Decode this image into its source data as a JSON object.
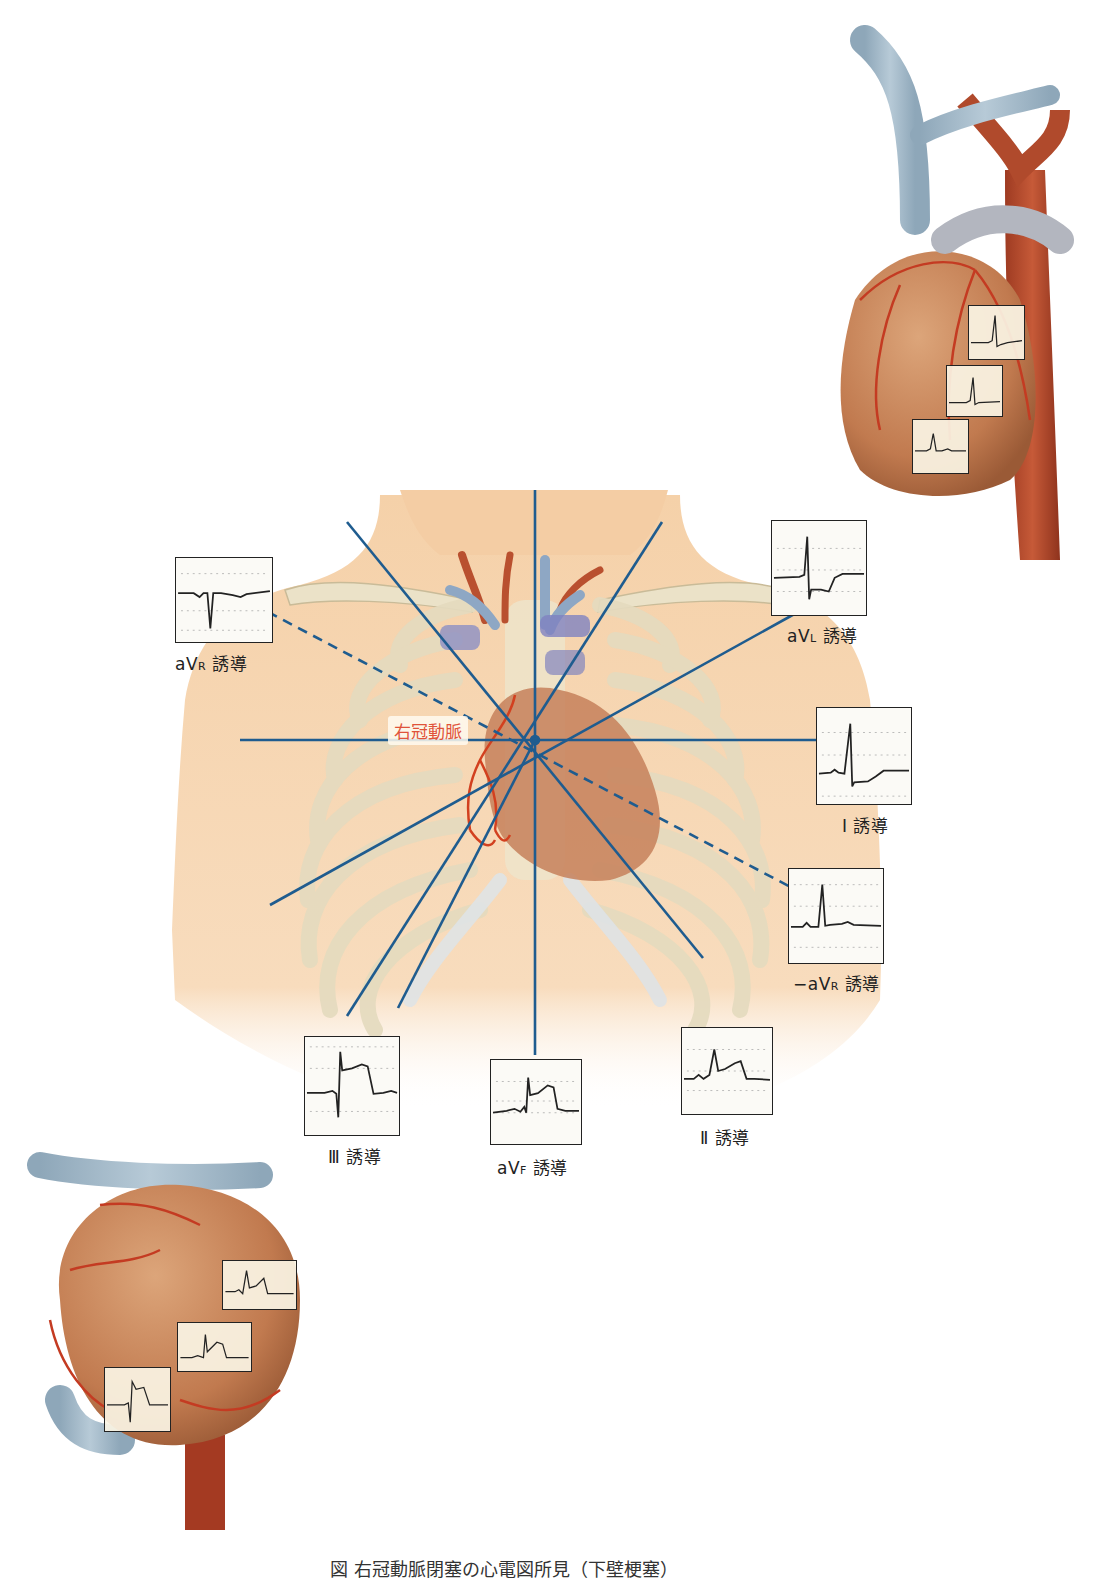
{
  "diagram": {
    "title_caption": "図 右冠動脈閉塞の心電図所見（下壁梗塞）",
    "rca_label": "右冠動脈",
    "center": {
      "x": 535,
      "y": 740
    },
    "axis_color": "#1f5c8f",
    "rca_color": "#e0533a",
    "leads": [
      {
        "id": "aVR",
        "label_main": "aV",
        "label_sub": "R",
        "label_suffix": "誘導",
        "box": {
          "x": 175,
          "y": 557,
          "w": 98,
          "h": 86
        },
        "label_pos": {
          "x": 175,
          "y": 650
        },
        "waveform": "negative-qrs"
      },
      {
        "id": "aVL",
        "label_main": "aV",
        "label_sub": "L",
        "label_suffix": "誘導",
        "box": {
          "x": 771,
          "y": 520,
          "w": 96,
          "h": 96
        },
        "label_pos": {
          "x": 787,
          "y": 622
        },
        "waveform": "r-with-st-depression"
      },
      {
        "id": "I",
        "label_main": "Ⅰ",
        "label_sub": "",
        "label_suffix": "誘導",
        "box": {
          "x": 816,
          "y": 707,
          "w": 96,
          "h": 98
        },
        "label_pos": {
          "x": 842,
          "y": 812
        },
        "waveform": "r-with-st-depression"
      },
      {
        "id": "-aVR",
        "label_main": "−aV",
        "label_sub": "R",
        "label_suffix": "誘導",
        "box": {
          "x": 788,
          "y": 868,
          "w": 96,
          "h": 96
        },
        "label_pos": {
          "x": 793,
          "y": 970
        },
        "waveform": "upright-qrs"
      },
      {
        "id": "II",
        "label_main": "Ⅱ",
        "label_sub": "",
        "label_suffix": "誘導",
        "box": {
          "x": 681,
          "y": 1027,
          "w": 92,
          "h": 88
        },
        "label_pos": {
          "x": 700,
          "y": 1124
        },
        "waveform": "st-elevation"
      },
      {
        "id": "aVF",
        "label_main": "aV",
        "label_sub": "F",
        "label_suffix": "誘導",
        "box": {
          "x": 490,
          "y": 1059,
          "w": 92,
          "h": 86
        },
        "label_pos": {
          "x": 497,
          "y": 1154
        },
        "waveform": "st-elevation"
      },
      {
        "id": "III",
        "label_main": "Ⅲ",
        "label_sub": "",
        "label_suffix": "誘導",
        "box": {
          "x": 304,
          "y": 1036,
          "w": 96,
          "h": 100
        },
        "label_pos": {
          "x": 328,
          "y": 1143
        },
        "waveform": "st-elevation-deep-s"
      }
    ],
    "axes": [
      {
        "name": "vertical-axis",
        "angle_deg": 90,
        "dashed": false
      },
      {
        "name": "horizontal-axis",
        "angle_deg": 0,
        "dashed": false
      },
      {
        "name": "aVL-axis",
        "angle_deg": -60,
        "dashed": false
      },
      {
        "name": "aVL-30-axis",
        "angle_deg": -30,
        "dashed": false
      },
      {
        "name": "aVR-axis",
        "angle_deg": 30,
        "dashed": true
      }
    ],
    "front_heart": {
      "mini_ecgs": 3
    },
    "inferior_heart": {
      "mini_ecgs": 3
    }
  }
}
